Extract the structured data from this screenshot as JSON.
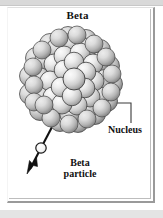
{
  "figure": {
    "title": "Beta",
    "background_color": "#ffffff",
    "frame_color": "#9a9a9a",
    "text_color": "#111111"
  },
  "labels": {
    "nucleus": "Nucleus",
    "beta_particle_line1": "Beta",
    "beta_particle_line2": "particle"
  },
  "nucleus": {
    "name": "nucleus-sphere-cluster",
    "sphere_fill_light": "#f0f0f0",
    "sphere_fill_mid": "#c9c9c9",
    "sphere_fill_dark": "#8e8e8e",
    "sphere_outline": "#3a3a3a",
    "center_x": 71,
    "center_y": 83,
    "radius": 46,
    "sphere_count": 61
  },
  "beta_particle": {
    "name": "emitted-beta-particle",
    "fill": "#ffffff",
    "outline": "#1a1a1a",
    "center_x": 41,
    "center_y": 148,
    "radius": 5
  },
  "emission_arrow": {
    "name": "emission-arrow",
    "color": "#111111",
    "start_x": 52,
    "start_y": 127,
    "end_x": 27,
    "end_y": 174
  },
  "leader_line": {
    "name": "nucleus-leader-line",
    "color": "#3a3a3a",
    "from_x": 104,
    "from_y": 103,
    "corner_x": 131,
    "corner_y": 103,
    "to_x": 131,
    "to_y": 123
  }
}
